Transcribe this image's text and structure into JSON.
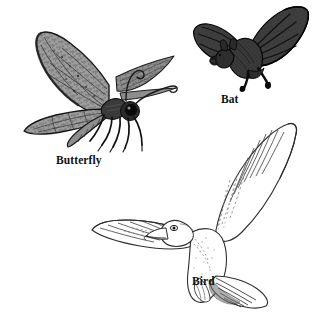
{
  "plate": {
    "title": "Flying Animals",
    "background_color": "#ffffff",
    "width": 321,
    "height": 320
  },
  "figures": [
    {
      "id": "butterfly",
      "label": "Butterfly",
      "icon": "moth-illustration",
      "description": "Shaded gray moth with outstretched patterned wings, curled proboscis, large dark eye and six legs",
      "fill_color": "#9a9a9a",
      "detail_color": "#2b2b2b",
      "outline_color": "#1a1a1a",
      "position": "upper-left"
    },
    {
      "id": "bat",
      "label": "Bat",
      "icon": "bat-illustration",
      "description": "Dark gray bat in flight with membranous wings, visible finger bones and two trailing legs",
      "fill_color": "#3a3a3a",
      "detail_color": "#151515",
      "outline_color": "#000000",
      "position": "upper-right"
    },
    {
      "id": "bird",
      "label": "Bird",
      "icon": "bird-illustration",
      "description": "White line-art gull gliding with one wing raised, fanned tail feathers and hooked beak",
      "fill_color": "#ffffff",
      "detail_color": "#6b6b6b",
      "outline_color": "#2a2a2a",
      "position": "lower-right"
    }
  ],
  "colors": {
    "page_background": "#ffffff",
    "caption_text": "#121212",
    "moth_wing_gray": "#9a9a9a",
    "bat_body_gray": "#3a3a3a",
    "bird_line_gray": "#5f5f5f"
  }
}
